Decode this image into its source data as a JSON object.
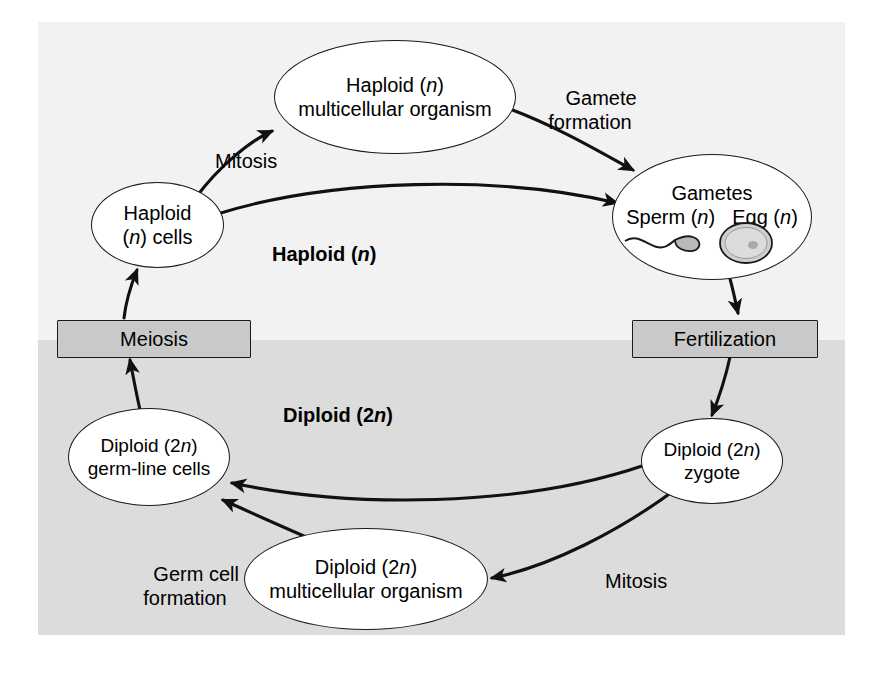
{
  "figure": {
    "zones": [
      {
        "key": "haploid",
        "label_pre": "Haploid (",
        "label_ital": "n",
        "label_post": ")",
        "bg": "#f2f2f2"
      },
      {
        "key": "diploid",
        "label_pre": "Diploid (2",
        "label_ital": "n",
        "label_post": ")",
        "bg": "#dcdcdc"
      }
    ],
    "nodes": {
      "haploid_organism": {
        "line1_pre": "Haploid (",
        "line1_ital": "n",
        "line1_post": ")",
        "line2": "multicellular organism"
      },
      "haploid_cells": {
        "line1": "Haploid",
        "line2_pre": "(",
        "line2_ital": "n",
        "line2_post": ") cells"
      },
      "gametes": {
        "line1": "Gametes",
        "line2_a": "Sperm (",
        "line2_a_ital": "n",
        "line2_a_post": ")",
        "line2_b": "Egg (",
        "line2_b_ital": "n",
        "line2_b_post": ")"
      },
      "zygote": {
        "line1_pre": "Diploid (2",
        "line1_ital": "n",
        "line1_post": ")",
        "line2": "zygote"
      },
      "diploid_organism": {
        "line1_pre": "Diploid (2",
        "line1_ital": "n",
        "line1_post": ")",
        "line2": "multicellular organism"
      },
      "germline_cells": {
        "line1_pre": "Diploid (2",
        "line1_ital": "n",
        "line1_post": ")",
        "line2": "germ-line cells"
      },
      "meiosis_box": {
        "label": "Meiosis"
      },
      "fertilization_box": {
        "label": "Fertilization"
      }
    },
    "edge_labels": {
      "mitosis_top": "Mitosis",
      "gamete_formation": "Gamete\nformation",
      "mitosis_bottom": "Mitosis",
      "germ_cell_formation": "Germ cell\nformation"
    },
    "icons": {
      "sperm": "sperm-icon",
      "egg": "egg-icon"
    },
    "colors": {
      "haploid_band": "#f2f2f2",
      "diploid_band": "#dcdcdc",
      "box_fill": "#c9c9c9",
      "stroke": "#1a1a1a",
      "node_fill": "#ffffff"
    }
  }
}
